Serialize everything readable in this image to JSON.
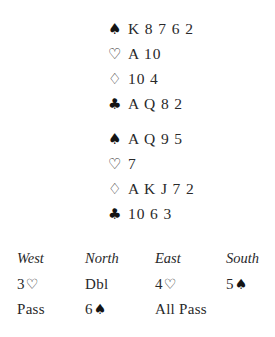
{
  "document": {
    "type": "bridge-deal-diagram"
  },
  "suit_glyphs": {
    "spade": "♠",
    "heart": "♡",
    "diamond": "♢",
    "club": "♣"
  },
  "hands": [
    {
      "position": "north",
      "rows": [
        {
          "suit": "spade",
          "suit_symbol": "♠",
          "filled": true,
          "ranks": "K 8 7 6 2"
        },
        {
          "suit": "heart",
          "suit_symbol": "♡",
          "filled": false,
          "ranks": "A 10"
        },
        {
          "suit": "diamond",
          "suit_symbol": "♢",
          "filled": false,
          "ranks": "10 4"
        },
        {
          "suit": "club",
          "suit_symbol": "♣",
          "filled": true,
          "ranks": "A Q 8 2"
        }
      ]
    },
    {
      "position": "south",
      "rows": [
        {
          "suit": "spade",
          "suit_symbol": "♠",
          "filled": true,
          "ranks": "A Q 9 5"
        },
        {
          "suit": "heart",
          "suit_symbol": "♡",
          "filled": false,
          "ranks": "7"
        },
        {
          "suit": "diamond",
          "suit_symbol": "♢",
          "filled": false,
          "ranks": "A K J 7 2"
        },
        {
          "suit": "club",
          "suit_symbol": "♣",
          "filled": true,
          "ranks": "10 6 3"
        }
      ]
    }
  ],
  "auction": {
    "headers": {
      "west": "West",
      "north": "North",
      "east": "East",
      "south": "South"
    },
    "rows": [
      {
        "west": {
          "level": "3",
          "symbol": "♡"
        },
        "north": {
          "level": "Dbl",
          "symbol": ""
        },
        "east": {
          "level": "4",
          "symbol": "♡"
        },
        "south": {
          "level": "5",
          "symbol": "♠"
        }
      },
      {
        "west": {
          "level": "Pass",
          "symbol": ""
        },
        "north": {
          "level": "6",
          "symbol": "♠"
        },
        "east": {
          "level": "All Pass",
          "symbol": ""
        },
        "south": {
          "level": "",
          "symbol": ""
        }
      }
    ]
  },
  "colors": {
    "background": "#ffffff",
    "text": "#29292a",
    "suit_black": "#141414"
  }
}
